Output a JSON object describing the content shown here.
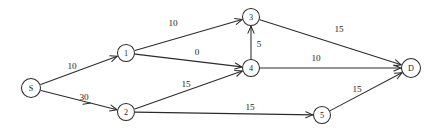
{
  "diagram": {
    "type": "directed-weighted-graph",
    "background_color": "#ffffff",
    "stroke_color": "#2b2b2b",
    "text_color": "#1d1d1d",
    "nodes": [
      {
        "id": "S",
        "label": "S",
        "x": 31,
        "y": 88,
        "r": 9.5
      },
      {
        "id": "1",
        "label": "1",
        "x": 126,
        "y": 53,
        "r": 8.5
      },
      {
        "id": "2",
        "label": "2",
        "x": 126,
        "y": 112,
        "r": 8.5
      },
      {
        "id": "3",
        "label": "3",
        "x": 251,
        "y": 17,
        "r": 8.5
      },
      {
        "id": "4",
        "label": "4",
        "x": 251,
        "y": 68,
        "r": 8.5
      },
      {
        "id": "5",
        "label": "5",
        "x": 322,
        "y": 115,
        "r": 8.5
      },
      {
        "id": "D",
        "label": "D",
        "x": 411,
        "y": 68,
        "r": 9.5
      }
    ],
    "edges": [
      {
        "from": "S",
        "to": "1",
        "weight": "10",
        "label_x": 72,
        "label_y": 66
      },
      {
        "from": "S",
        "to": "2",
        "weight": "30",
        "label_x": 84,
        "label_y": 97
      },
      {
        "from": "1",
        "to": "3",
        "weight": "10",
        "label_x": 173,
        "label_y": 23
      },
      {
        "from": "1",
        "to": "4",
        "weight": "0",
        "label_x": 197,
        "label_y": 52
      },
      {
        "from": "2",
        "to": "4",
        "weight": "15",
        "label_x": 186,
        "label_y": 84
      },
      {
        "from": "2",
        "to": "5",
        "weight": "15",
        "label_x": 250,
        "label_y": 107
      },
      {
        "from": "4",
        "to": "3",
        "weight": "5",
        "label_x": 259,
        "label_y": 44
      },
      {
        "from": "4",
        "to": "D",
        "weight": "10",
        "label_x": 316,
        "label_y": 58
      },
      {
        "from": "3",
        "to": "D",
        "weight": "15",
        "label_x": 339,
        "label_y": 29
      },
      {
        "from": "5",
        "to": "D",
        "weight": "15",
        "label_x": 357,
        "label_y": 89
      }
    ]
  }
}
